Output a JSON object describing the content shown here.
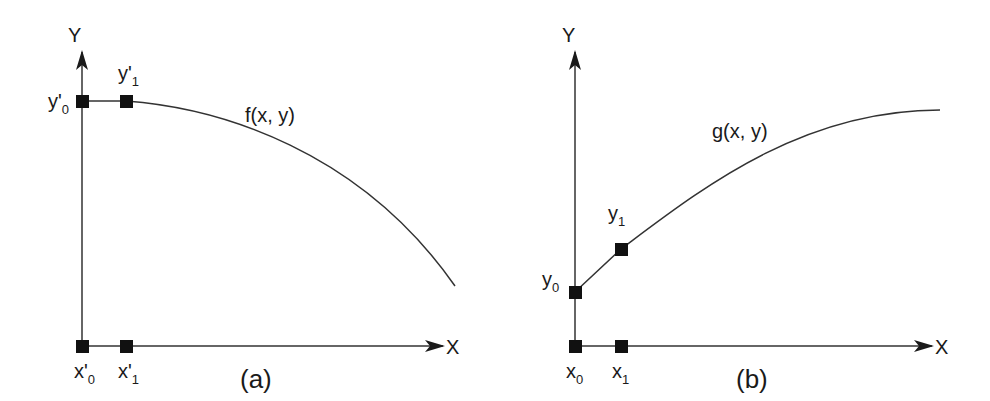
{
  "panels": [
    {
      "id": "a",
      "caption": "(a)",
      "y_axis_label": "Y",
      "x_axis_label": "X",
      "function_label": "f(x, y)",
      "points": {
        "y0": {
          "base": "y'",
          "sub": "0"
        },
        "y1": {
          "base": "y'",
          "sub": "1"
        },
        "x0": {
          "base": "x'",
          "sub": "0"
        },
        "x1": {
          "base": "x'",
          "sub": "1"
        }
      }
    },
    {
      "id": "b",
      "caption": "(b)",
      "y_axis_label": "Y",
      "x_axis_label": "X",
      "function_label": "g(x, y)",
      "points": {
        "y0": {
          "base": "y",
          "sub": "0"
        },
        "y1": {
          "base": "y",
          "sub": "1"
        },
        "x0": {
          "base": "x",
          "sub": "0"
        },
        "x1": {
          "base": "x",
          "sub": "1"
        }
      }
    }
  ],
  "colors": {
    "ink": "#1a1a1a",
    "line": "#333333",
    "background": "#ffffff"
  }
}
